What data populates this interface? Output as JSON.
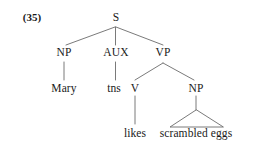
{
  "figure": {
    "example_number": "(35)",
    "line_color": "#6b6b6b",
    "text_color": "#1a1a1a",
    "background_color": "#ffffff"
  },
  "tree": {
    "nodes": {
      "s": "S",
      "np_subject": "NP",
      "aux": "AUX",
      "vp": "VP",
      "v": "V",
      "np_object": "NP"
    },
    "terminals": {
      "mary": "Mary",
      "tns": "tns",
      "likes": "likes",
      "scrambled_eggs": "scrambled eggs"
    }
  }
}
